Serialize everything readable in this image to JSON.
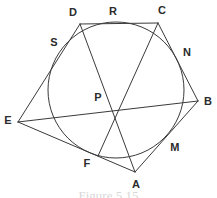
{
  "figure": {
    "caption": "Figure  5.15",
    "stroke_color": "#3a3a3a",
    "label_color": "#2b2b2b",
    "background_color": "#ffffff",
    "stroke_width": 1
  },
  "circle": {
    "name": "inscribed-circle",
    "cx": 116,
    "cy": 90,
    "r": 68
  },
  "points": {
    "D": {
      "label": "D",
      "x": 80,
      "y": 24,
      "label_x": 73,
      "label_y": 12,
      "kind": "pentagon-vertex"
    },
    "C": {
      "label": "C",
      "x": 158,
      "y": 23,
      "label_x": 162,
      "label_y": 10,
      "kind": "pentagon-vertex"
    },
    "B": {
      "label": "B",
      "x": 198,
      "y": 101,
      "label_x": 208,
      "label_y": 101,
      "kind": "pentagon-vertex"
    },
    "A": {
      "label": "A",
      "x": 135,
      "y": 172,
      "label_x": 136,
      "label_y": 184,
      "kind": "pentagon-vertex"
    },
    "E": {
      "label": "E",
      "x": 18,
      "y": 122,
      "label_x": 8,
      "label_y": 120,
      "kind": "pentagon-vertex"
    },
    "R": {
      "label": "R",
      "x": 119,
      "y": 22,
      "label_x": 113,
      "label_y": 11,
      "kind": "tangent-point"
    },
    "N": {
      "label": "N",
      "x": 180,
      "y": 64,
      "label_x": 187,
      "label_y": 52,
      "kind": "tangent-point"
    },
    "M": {
      "label": "M",
      "x": 165,
      "y": 142,
      "label_x": 175,
      "label_y": 147,
      "kind": "tangent-point"
    },
    "F": {
      "label": "F",
      "x": 98,
      "y": 156,
      "label_x": 87,
      "label_y": 163,
      "kind": "tangent-point"
    },
    "S": {
      "label": "S",
      "x": 63,
      "y": 54,
      "label_x": 54,
      "label_y": 42,
      "kind": "tangent-point"
    },
    "P": {
      "label": "P",
      "x": 112,
      "y": 107,
      "label_x": 98,
      "label_y": 97,
      "kind": "intersection-point"
    }
  },
  "polygon": {
    "name": "circumscribed-pentagon",
    "vertex_order": [
      "D",
      "C",
      "B",
      "A",
      "E"
    ],
    "sides": [
      {
        "name": "side-DC",
        "from": "D",
        "to": "C",
        "tangent_at": "R"
      },
      {
        "name": "side-CB",
        "from": "C",
        "to": "B",
        "tangent_at": "N"
      },
      {
        "name": "side-BA",
        "from": "B",
        "to": "A",
        "tangent_at": "M"
      },
      {
        "name": "side-AE",
        "from": "A",
        "to": "E",
        "tangent_at": "F"
      },
      {
        "name": "side-ED",
        "from": "E",
        "to": "D",
        "tangent_at": "S"
      }
    ]
  },
  "cevians": [
    {
      "name": "cevian-AD",
      "from": "A",
      "to": "D",
      "through": "P"
    },
    {
      "name": "cevian-CF",
      "from": "C",
      "to": "F",
      "through": "P"
    },
    {
      "name": "cevian-EB",
      "from": "E",
      "to": "B",
      "through": "P"
    }
  ]
}
